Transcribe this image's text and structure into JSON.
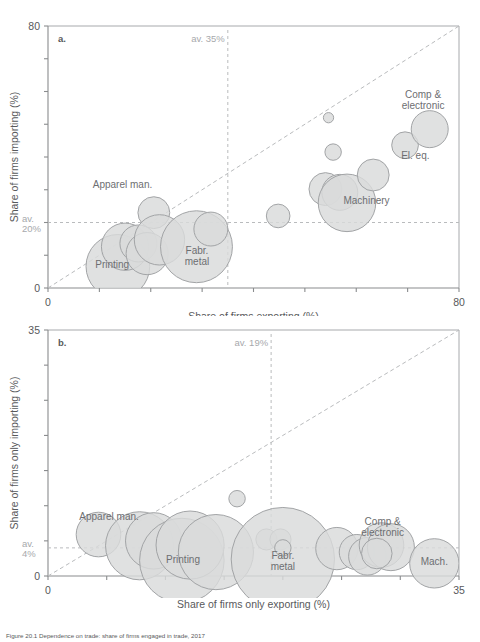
{
  "figure": {
    "caption": "Figure 20.1 Dependence on trade: share of firms engaged in trade, 2017"
  },
  "chart_data": [
    {
      "id": "panel-a",
      "type": "scatter",
      "panel_label": "a.",
      "title": "",
      "xlabel": "Share of firms exporting (%)",
      "ylabel": "Share  of firms importing (%)",
      "xlim": [
        0,
        80
      ],
      "ylim": [
        0,
        80
      ],
      "xticks": [
        0,
        10,
        20,
        30,
        40,
        50,
        60,
        70,
        80
      ],
      "yticks": [
        0,
        10,
        20,
        30,
        40,
        50,
        60,
        70,
        80
      ],
      "xtick_labels_shown": [
        "0",
        "80"
      ],
      "ytick_labels_shown": [
        "0",
        "80"
      ],
      "grid": false,
      "legend": "none",
      "reference_lines": [
        {
          "name": "average-exporting",
          "orientation": "vertical",
          "value": 35,
          "label": "av. 35%"
        },
        {
          "name": "average-importing",
          "orientation": "horizontal",
          "value": 20,
          "label": "av.\n20%"
        },
        {
          "name": "parity-45-degree",
          "orientation": "diagonal",
          "from": [
            0,
            0
          ],
          "to": [
            80,
            80
          ],
          "label": ""
        }
      ],
      "annotations": [
        {
          "text": "Apparel man.",
          "x": 14.5,
          "y": 30.5
        },
        {
          "text": "Printing",
          "x": 12.5,
          "y": 6.0
        },
        {
          "text": "Fabr. metal",
          "x": 29.0,
          "y": 10.5
        },
        {
          "text": "Machinery",
          "x": 62.0,
          "y": 25.5
        },
        {
          "text": "El. eq.",
          "x": 71.5,
          "y": 39.5
        },
        {
          "text": "Comp & electronic",
          "x": 73.0,
          "y": 58.0
        }
      ],
      "points": [
        {
          "label": "Printing",
          "x": 13.6,
          "y": 6.6,
          "size": 6.2
        },
        {
          "label": "",
          "x": 15.0,
          "y": 12.6,
          "size": 4.6
        },
        {
          "label": "",
          "x": 17.6,
          "y": 13.6,
          "size": 3.6
        },
        {
          "label": "",
          "x": 19.3,
          "y": 10.5,
          "size": 4.1
        },
        {
          "label": "Apparel man.",
          "x": 20.6,
          "y": 23.0,
          "size": 3.1
        },
        {
          "label": "",
          "x": 21.7,
          "y": 14.7,
          "size": 4.9
        },
        {
          "label": "Fabr. metal",
          "x": 28.9,
          "y": 12.6,
          "size": 7.0
        },
        {
          "label": "",
          "x": 31.7,
          "y": 18.0,
          "size": 3.3
        },
        {
          "label": "",
          "x": 44.8,
          "y": 22.0,
          "size": 2.3
        },
        {
          "label": "",
          "x": 54.0,
          "y": 30.2,
          "size": 3.2
        },
        {
          "label": "",
          "x": 56.8,
          "y": 29.2,
          "size": 3.5
        },
        {
          "label": "Machinery",
          "x": 58.2,
          "y": 26.0,
          "size": 5.6
        },
        {
          "label": "",
          "x": 55.5,
          "y": 41.5,
          "size": 1.6
        },
        {
          "label": "",
          "x": 54.6,
          "y": 52.0,
          "size": 1.0
        },
        {
          "label": "",
          "x": 63.3,
          "y": 34.5,
          "size": 3.1
        },
        {
          "label": "El. eq.",
          "x": 69.5,
          "y": 43.6,
          "size": 2.6
        },
        {
          "label": "Comp & electronic",
          "x": 74.3,
          "y": 48.5,
          "size": 3.6
        }
      ]
    },
    {
      "id": "panel-b",
      "type": "scatter",
      "panel_label": "b.",
      "title": "",
      "xlabel": "Share of firms only exporting (%)",
      "ylabel": "Share  of firms only importing (%)",
      "xlim": [
        0,
        35
      ],
      "ylim": [
        0,
        35
      ],
      "xticks": [
        0,
        5,
        10,
        15,
        20,
        25,
        30,
        35
      ],
      "yticks": [
        0,
        5,
        10,
        15,
        20,
        25,
        30,
        35
      ],
      "xtick_labels_shown": [
        "0",
        "35"
      ],
      "ytick_labels_shown": [
        "0",
        "35"
      ],
      "grid": false,
      "legend": "none",
      "reference_lines": [
        {
          "name": "average-only-exporting",
          "orientation": "vertical",
          "value": 19,
          "label": "av. 19%"
        },
        {
          "name": "average-only-importing",
          "orientation": "horizontal",
          "value": 4,
          "label": "av.\n4%"
        },
        {
          "name": "parity-45-degree",
          "orientation": "diagonal",
          "from": [
            0,
            0
          ],
          "to": [
            35,
            35
          ],
          "label": ""
        }
      ],
      "annotations": [
        {
          "text": "Apparel man.",
          "x": 5.2,
          "y": 8.0
        },
        {
          "text": "Printing",
          "x": 11.5,
          "y": 1.9
        },
        {
          "text": "Fabr. metal",
          "x": 20.0,
          "y": 2.4
        },
        {
          "text": "Comp & electronic",
          "x": 28.5,
          "y": 7.2
        },
        {
          "text": "Mach.",
          "x": 32.9,
          "y": 1.6
        }
      ],
      "points": [
        {
          "label": "Apparel man.",
          "x": 4.3,
          "y": 5.9,
          "size": 1.9
        },
        {
          "label": "",
          "x": 7.8,
          "y": 4.3,
          "size": 2.9
        },
        {
          "label": "",
          "x": 9.0,
          "y": 5.0,
          "size": 2.4
        },
        {
          "label": "Printing",
          "x": 11.4,
          "y": 2.2,
          "size": 3.6
        },
        {
          "label": "",
          "x": 12.1,
          "y": 4.4,
          "size": 2.9
        },
        {
          "label": "",
          "x": 14.3,
          "y": 3.4,
          "size": 3.2
        },
        {
          "label": "",
          "x": 16.1,
          "y": 11.0,
          "size": 0.7
        },
        {
          "label": "",
          "x": 18.6,
          "y": 5.2,
          "size": 0.9
        },
        {
          "label": "",
          "x": 19.8,
          "y": 5.2,
          "size": 0.9
        },
        {
          "label": "Fabr. metal",
          "x": 20.0,
          "y": 2.4,
          "size": 4.4
        },
        {
          "label": "",
          "x": 20.0,
          "y": 4.0,
          "size": 0.7
        },
        {
          "label": "",
          "x": 24.6,
          "y": 3.9,
          "size": 1.8
        },
        {
          "label": "",
          "x": 26.3,
          "y": 3.4,
          "size": 1.5
        },
        {
          "label": "",
          "x": 27.2,
          "y": 2.8,
          "size": 1.6
        },
        {
          "label": "",
          "x": 28.4,
          "y": 4.4,
          "size": 1.9
        },
        {
          "label": "Comp & electronic",
          "x": 29.2,
          "y": 4.1,
          "size": 2.0
        },
        {
          "label": "",
          "x": 28.0,
          "y": 3.2,
          "size": 1.3
        },
        {
          "label": "Mach.",
          "x": 32.9,
          "y": 1.8,
          "size": 2.1
        }
      ]
    }
  ]
}
